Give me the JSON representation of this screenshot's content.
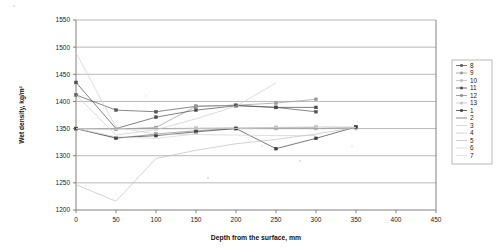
{
  "chart_data": {
    "type": "line",
    "title": "",
    "xlabel": "Depth from the surface, mm",
    "ylabel": "Wet density, kg/m³",
    "xlim": [
      0,
      450
    ],
    "ylim": [
      1200,
      1550
    ],
    "xticks": [
      0,
      50,
      100,
      150,
      200,
      250,
      300,
      350,
      400,
      450
    ],
    "yticks": [
      1200,
      1250,
      1300,
      1350,
      1400,
      1450,
      1500,
      1550
    ],
    "grid": "horizontal",
    "legend_position": "right",
    "legend_entries": [
      "8",
      "9",
      "10",
      "11",
      "12",
      "13",
      "1",
      "2",
      "3",
      "4",
      "5",
      "6",
      "7"
    ],
    "series": [
      {
        "name": "8",
        "color": "#555555",
        "marker": "square",
        "x": [
          0,
          50,
          100,
          150,
          200,
          250,
          300
        ],
        "values": [
          1412,
          1384,
          1381,
          1391,
          1393,
          1389,
          1381
        ]
      },
      {
        "name": "9",
        "color": "#999999",
        "marker": "square",
        "x": [
          0,
          50,
          100,
          150,
          200,
          250,
          300
        ],
        "values": [
          1350,
          1349,
          1352,
          1391,
          1393,
          1397,
          1404
        ]
      },
      {
        "name": "10",
        "color": "#bbbbbb",
        "marker": "square",
        "x": [
          0,
          50,
          100,
          150,
          200,
          250,
          300,
          350
        ],
        "values": [
          1350,
          1350,
          1350,
          1350,
          1350,
          1350,
          1350,
          1350
        ]
      },
      {
        "name": "11",
        "color": "#4a4a4a",
        "marker": "square",
        "x": [
          0,
          50,
          100,
          150,
          200,
          250,
          300
        ],
        "values": [
          1435,
          1350,
          1371,
          1384,
          1392,
          1389,
          1389
        ]
      },
      {
        "name": "12",
        "color": "#8a8a8a",
        "marker": "square",
        "x": [
          0,
          50,
          100,
          150,
          200,
          250,
          300
        ],
        "values": [
          1350,
          1332,
          1340,
          1346,
          1350,
          1352,
          1352
        ]
      },
      {
        "name": "13",
        "color": "#c4c4c4",
        "marker": "square",
        "x": [
          0,
          50,
          100,
          150,
          200,
          250,
          300,
          350
        ],
        "values": [
          1350,
          1350,
          1350,
          1351,
          1352,
          1352,
          1353,
          1353
        ]
      },
      {
        "name": "1",
        "color": "#3d3d3d",
        "marker": "square",
        "x": [
          0,
          50,
          100,
          150,
          200,
          250,
          300,
          350
        ],
        "values": [
          1350,
          1333,
          1337,
          1344,
          1350,
          1313,
          1332,
          1353
        ]
      },
      {
        "name": "2",
        "color": "#707070",
        "marker": "none",
        "x": [
          0,
          50,
          100,
          150,
          200,
          250,
          300,
          350
        ],
        "values": [
          1350,
          1350,
          1350,
          1350,
          1350,
          1350,
          1350,
          1352
        ]
      },
      {
        "name": "3",
        "color": "#d0d0d0",
        "marker": "none",
        "x": [
          0,
          50,
          100,
          150,
          200,
          250,
          300
        ],
        "values": [
          1490,
          1352,
          1340,
          1339,
          1338,
          1337,
          1337
        ]
      },
      {
        "name": "4",
        "color": "#cccccc",
        "marker": "none",
        "x": [
          0,
          50,
          100,
          150,
          200,
          250
        ],
        "values": [
          1412,
          1338,
          1348,
          1368,
          1391,
          1434
        ]
      },
      {
        "name": "5",
        "color": "#bfbfbf",
        "marker": "none",
        "x": [
          0,
          50,
          100,
          150,
          200,
          250,
          300,
          350
        ],
        "values": [
          1247,
          1216,
          1295,
          1310,
          1322,
          1330,
          1340,
          1352
        ]
      },
      {
        "name": "6",
        "color": "#d5d5d5",
        "marker": "none",
        "x": [
          0,
          50,
          100,
          150
        ],
        "values": [
          1350,
          1335,
          1332,
          1340
        ]
      },
      {
        "name": "7",
        "color": "#dedede",
        "marker": "none",
        "x": [
          0,
          50,
          100,
          150,
          200,
          250,
          300,
          350
        ],
        "values": [
          1350,
          1349,
          1349,
          1350,
          1350,
          1351,
          1351,
          1352
        ]
      }
    ]
  }
}
